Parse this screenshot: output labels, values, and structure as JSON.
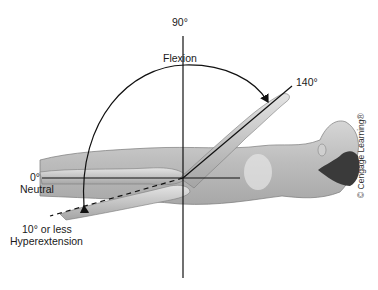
{
  "diagram": {
    "labels": {
      "vertical_angle": "90°",
      "flexion": "Flexion",
      "flexion_limit": "140°",
      "neutral_angle": "0°",
      "neutral": "Neutral",
      "hyperextension_angle": "10° or less",
      "hyperextension": "Hyperextension"
    },
    "copyright": "© Cengage Learning®",
    "colors": {
      "line": "#111111",
      "skin_light": "#e2e2e2",
      "skin_mid": "#bdbdbd",
      "skin_dark": "#8c8c8c",
      "hair": "#3a3a3a",
      "background": "#ffffff"
    },
    "angles": {
      "neutral_deg": 0,
      "vertical_deg": 90,
      "flexion_deg": 140,
      "hyperextension_deg": 10
    }
  }
}
